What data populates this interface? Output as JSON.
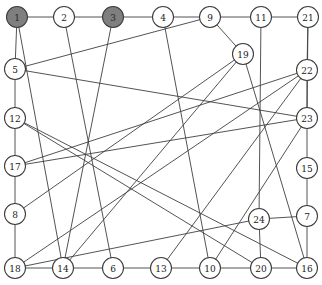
{
  "figure": {
    "width": 322,
    "height": 285,
    "background_color": "#ffffff"
  },
  "style": {
    "node_fill_plain": "#ffffff",
    "node_fill_marked": "#7f7f7f",
    "node_stroke": "#3a3a3a",
    "edge_color": "#3f3f3f",
    "label_color": "#1a1a1a",
    "node_radius": 10.5
  },
  "chart_data": {
    "type": "diagram",
    "subtype": "node-link-graph",
    "title": "",
    "directed": false,
    "node_count": 24,
    "edge_count": 44,
    "marked_nodes": [
      "1",
      "3"
    ],
    "nodes": [
      {
        "id": "1",
        "label": "1",
        "x": 17,
        "y": 17,
        "marked": true
      },
      {
        "id": "2",
        "label": "2",
        "x": 64,
        "y": 17,
        "marked": false
      },
      {
        "id": "3",
        "label": "3",
        "x": 113,
        "y": 17,
        "marked": true
      },
      {
        "id": "4",
        "label": "4",
        "x": 163,
        "y": 17,
        "marked": false
      },
      {
        "id": "9",
        "label": "9",
        "x": 210,
        "y": 17,
        "marked": false
      },
      {
        "id": "11",
        "label": "11",
        "x": 261,
        "y": 17,
        "marked": false
      },
      {
        "id": "21",
        "label": "21",
        "x": 308,
        "y": 17,
        "marked": false
      },
      {
        "id": "19",
        "label": "19",
        "x": 243,
        "y": 54,
        "marked": false
      },
      {
        "id": "5",
        "label": "5",
        "x": 15,
        "y": 69,
        "marked": false
      },
      {
        "id": "22",
        "label": "22",
        "x": 307,
        "y": 70,
        "marked": false
      },
      {
        "id": "12",
        "label": "12",
        "x": 15,
        "y": 118,
        "marked": false
      },
      {
        "id": "23",
        "label": "23",
        "x": 307,
        "y": 118,
        "marked": false
      },
      {
        "id": "17",
        "label": "17",
        "x": 15,
        "y": 166,
        "marked": false
      },
      {
        "id": "15",
        "label": "15",
        "x": 307,
        "y": 168,
        "marked": false
      },
      {
        "id": "8",
        "label": "8",
        "x": 15,
        "y": 214,
        "marked": false
      },
      {
        "id": "24",
        "label": "24",
        "x": 259,
        "y": 219,
        "marked": false
      },
      {
        "id": "7",
        "label": "7",
        "x": 307,
        "y": 216,
        "marked": false
      },
      {
        "id": "18",
        "label": "18",
        "x": 15,
        "y": 268,
        "marked": false
      },
      {
        "id": "14",
        "label": "14",
        "x": 63,
        "y": 268,
        "marked": false
      },
      {
        "id": "6",
        "label": "6",
        "x": 113,
        "y": 268,
        "marked": false
      },
      {
        "id": "13",
        "label": "13",
        "x": 161,
        "y": 268,
        "marked": false
      },
      {
        "id": "10",
        "label": "10",
        "x": 210,
        "y": 268,
        "marked": false
      },
      {
        "id": "20",
        "label": "20",
        "x": 261,
        "y": 268,
        "marked": false
      },
      {
        "id": "16",
        "label": "16",
        "x": 307,
        "y": 268,
        "marked": false
      }
    ],
    "edges": [
      [
        "1",
        "2"
      ],
      [
        "2",
        "3"
      ],
      [
        "3",
        "4"
      ],
      [
        "4",
        "9"
      ],
      [
        "9",
        "11"
      ],
      [
        "11",
        "21"
      ],
      [
        "1",
        "5"
      ],
      [
        "5",
        "12"
      ],
      [
        "12",
        "17"
      ],
      [
        "17",
        "8"
      ],
      [
        "8",
        "18"
      ],
      [
        "21",
        "22"
      ],
      [
        "22",
        "23"
      ],
      [
        "23",
        "15"
      ],
      [
        "15",
        "7"
      ],
      [
        "7",
        "16"
      ],
      [
        "18",
        "14"
      ],
      [
        "14",
        "6"
      ],
      [
        "6",
        "13"
      ],
      [
        "13",
        "10"
      ],
      [
        "10",
        "20"
      ],
      [
        "20",
        "16"
      ],
      [
        "9",
        "19"
      ],
      [
        "1",
        "14"
      ],
      [
        "2",
        "6"
      ],
      [
        "3",
        "14"
      ],
      [
        "4",
        "10"
      ],
      [
        "5",
        "9"
      ],
      [
        "5",
        "23"
      ],
      [
        "12",
        "20"
      ],
      [
        "17",
        "23"
      ],
      [
        "17",
        "22"
      ],
      [
        "8",
        "19"
      ],
      [
        "18",
        "24"
      ],
      [
        "18",
        "22"
      ],
      [
        "19",
        "16"
      ],
      [
        "19",
        "14"
      ],
      [
        "21",
        "23"
      ],
      [
        "22",
        "13"
      ],
      [
        "23",
        "10"
      ],
      [
        "24",
        "20"
      ],
      [
        "24",
        "11"
      ],
      [
        "24",
        "7"
      ],
      [
        "12",
        "16"
      ]
    ]
  }
}
